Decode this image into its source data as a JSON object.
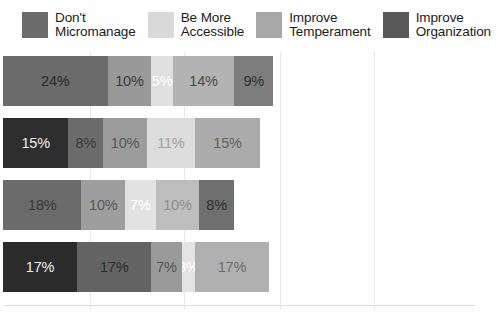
{
  "legend": {
    "position": "top",
    "items": [
      {
        "label": "Don't\nMicromanage",
        "color": "#6b6b6b",
        "icon": "legend-swatch-icon"
      },
      {
        "label": "Be More\nAccessible",
        "color": "#d9d9d9",
        "icon": "legend-swatch-icon"
      },
      {
        "label": "Improve\nTemperament",
        "color": "#a8a8a8",
        "icon": "legend-swatch-icon"
      },
      {
        "label": "Improve\nOrganization",
        "color": "#595959",
        "icon": "legend-swatch-icon"
      }
    ]
  },
  "chart_data": {
    "type": "bar",
    "orientation": "horizontal",
    "stacked": true,
    "title": "",
    "subtitle": "",
    "xlabel": "",
    "ylabel": "",
    "xlim": [
      0,
      100
    ],
    "grid": true,
    "xticks": [
      "",
      "",
      "",
      "",
      ""
    ],
    "categories": [
      "Bar 1",
      "Bar 2",
      "Bar 3",
      "Bar 4"
    ],
    "series": [
      {
        "name": "Don't Micromanage",
        "color": "#6b6b6b",
        "values": [
          24,
          8,
          18,
          17
        ]
      },
      {
        "name": "Be More Accessible",
        "color": "#d9d9d9",
        "values": [
          5,
          11,
          7,
          3
        ]
      },
      {
        "name": "Improve Temperament",
        "color": "#a8a8a8",
        "values": [
          14,
          15,
          10,
          17
        ]
      },
      {
        "name": "Improve Organization",
        "color": "#595959",
        "values": [
          9,
          15,
          8,
          17
        ]
      }
    ],
    "bars": [
      {
        "name": "row-1",
        "total": 62,
        "segments": [
          {
            "label": "24%",
            "value": 24,
            "color": "#6b6b6b",
            "text_color": "#2a2a2a"
          },
          {
            "label": "10%",
            "value": 10,
            "color": "#999999",
            "text_color": "#3a3a3a"
          },
          {
            "label": "5%",
            "value": 5,
            "color": "#e0e0e0",
            "text_color": "#ffffff"
          },
          {
            "label": "14%",
            "value": 14,
            "color": "#b3b3b3",
            "text_color": "#4a4a4a"
          },
          {
            "label": "9%",
            "value": 9,
            "color": "#7d7d7d",
            "text_color": "#2f2f2f"
          }
        ]
      },
      {
        "name": "row-2",
        "total": 59,
        "segments": [
          {
            "label": "15%",
            "value": 15,
            "color": "#2e2e2e",
            "text_color": "#f0f0f0"
          },
          {
            "label": "8%",
            "value": 8,
            "color": "#6b6b6b",
            "text_color": "#3a3a3a"
          },
          {
            "label": "10%",
            "value": 10,
            "color": "#9c9c9c",
            "text_color": "#565656"
          },
          {
            "label": "11%",
            "value": 11,
            "color": "#dcdcdc",
            "text_color": "#a0a0a0"
          },
          {
            "label": "15%",
            "value": 15,
            "color": "#ababab",
            "text_color": "#616161"
          }
        ]
      },
      {
        "name": "row-3",
        "total": 53,
        "segments": [
          {
            "label": "18%",
            "value": 18,
            "color": "#6b6b6b",
            "text_color": "#3a3a3a"
          },
          {
            "label": "10%",
            "value": 10,
            "color": "#9e9e9e",
            "text_color": "#575757"
          },
          {
            "label": "7%",
            "value": 7,
            "color": "#e2e2e2",
            "text_color": "#ffffff"
          },
          {
            "label": "10%",
            "value": 10,
            "color": "#bdbdbd",
            "text_color": "#8f8f8f"
          },
          {
            "label": "8%",
            "value": 8,
            "color": "#6f6f6f",
            "text_color": "#303030"
          }
        ]
      },
      {
        "name": "row-4",
        "total": 61,
        "segments": [
          {
            "label": "17%",
            "value": 17,
            "color": "#2b2b2b",
            "text_color": "#efefef"
          },
          {
            "label": "17%",
            "value": 17,
            "color": "#636363",
            "text_color": "#2e2e2e"
          },
          {
            "label": "7%",
            "value": 7,
            "color": "#9a9a9a",
            "text_color": "#535353"
          },
          {
            "label": "3%",
            "value": 3,
            "color": "#e4e4e4",
            "text_color": "#ffffff"
          },
          {
            "label": "17%",
            "value": 17,
            "color": "#b0b0b0",
            "text_color": "#6b6b6b"
          }
        ]
      }
    ]
  }
}
